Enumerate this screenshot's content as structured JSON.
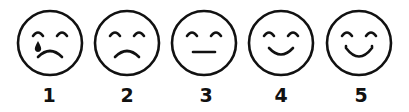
{
  "scale": {
    "title": "",
    "ink_color": "#111111",
    "items": [
      {
        "value": "1",
        "expression": "crying",
        "icon": "crying-face-icon"
      },
      {
        "value": "2",
        "expression": "sad",
        "icon": "sad-face-icon"
      },
      {
        "value": "3",
        "expression": "neutral",
        "icon": "neutral-face-icon"
      },
      {
        "value": "4",
        "expression": "slight-smile",
        "icon": "slightly-smiling-face-icon"
      },
      {
        "value": "5",
        "expression": "happy",
        "icon": "smiling-face-icon"
      }
    ]
  }
}
